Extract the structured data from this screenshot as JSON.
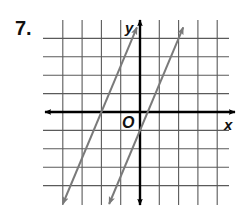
{
  "problem": {
    "number_label": "7."
  },
  "axes": {
    "x_label": "x",
    "y_label": "y",
    "origin_label": "O"
  },
  "colors": {
    "grid": "#5a5a5a",
    "axis": "#000000",
    "graph_line": "#7a7a7a",
    "background": "#ffffff"
  },
  "chart_data": {
    "type": "line",
    "title": "7.",
    "xlabel": "x",
    "ylabel": "y",
    "xlim": [
      -5,
      5
    ],
    "ylim": [
      -5,
      5
    ],
    "grid": true,
    "grid_x_ticks": [
      -4,
      -3,
      -2,
      -1,
      0,
      1,
      2,
      3,
      4
    ],
    "grid_y_ticks": [
      -4,
      -3,
      -2,
      -1,
      0,
      1,
      2,
      3,
      4
    ],
    "tick_labels_shown": false,
    "origin_label": "O",
    "series": [
      {
        "name": "line-left",
        "equation": "y = 2.5x + 5",
        "slope": 2.5,
        "intercept": 5,
        "x": [
          -4,
          -0.16
        ],
        "y": [
          -5,
          4.6
        ],
        "arrows": "both"
      },
      {
        "name": "line-right",
        "equation": "y = 2.5x - 1",
        "slope": 2.5,
        "intercept": -1,
        "x": [
          -1.6,
          2.24
        ],
        "y": [
          -5,
          4.6
        ],
        "arrows": "both"
      }
    ],
    "legend": null
  }
}
